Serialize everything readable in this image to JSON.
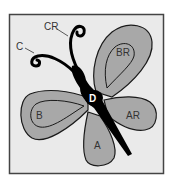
{
  "diagram": {
    "colors": {
      "background": "#ffffff",
      "frame_fill": "#eaeaea",
      "frame_border": "#444444",
      "wing_fill": "#a8a8a8",
      "outline": "#1a1a1a",
      "body": "#000000",
      "label_text": "#333333",
      "body_label_text": "#ffffff"
    },
    "labels": {
      "antenna_club": "CR",
      "antenna": "C",
      "upper_right_wing": "BR",
      "upper_left_wing": "B",
      "lower_right_wing": "AR",
      "lower_wing": "A",
      "body": "D"
    }
  }
}
